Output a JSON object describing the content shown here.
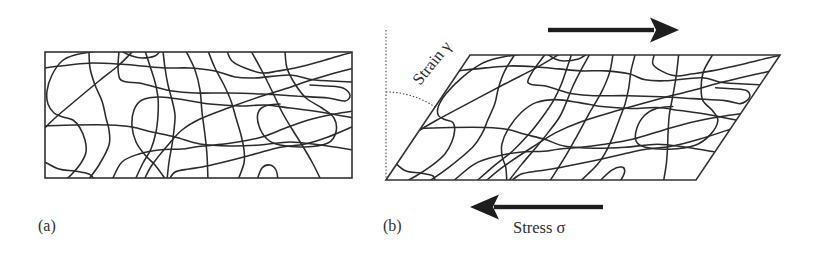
{
  "figure": {
    "panels": [
      {
        "id": "a",
        "label": "(a)"
      },
      {
        "id": "b",
        "label": "(b)"
      }
    ],
    "annotations": {
      "strain_label": "Strain γ",
      "stress_label": "Stress σ"
    },
    "arrows": [
      {
        "icon": "arrow-right-icon",
        "direction": "right"
      },
      {
        "icon": "arrow-left-icon",
        "direction": "left"
      }
    ]
  }
}
